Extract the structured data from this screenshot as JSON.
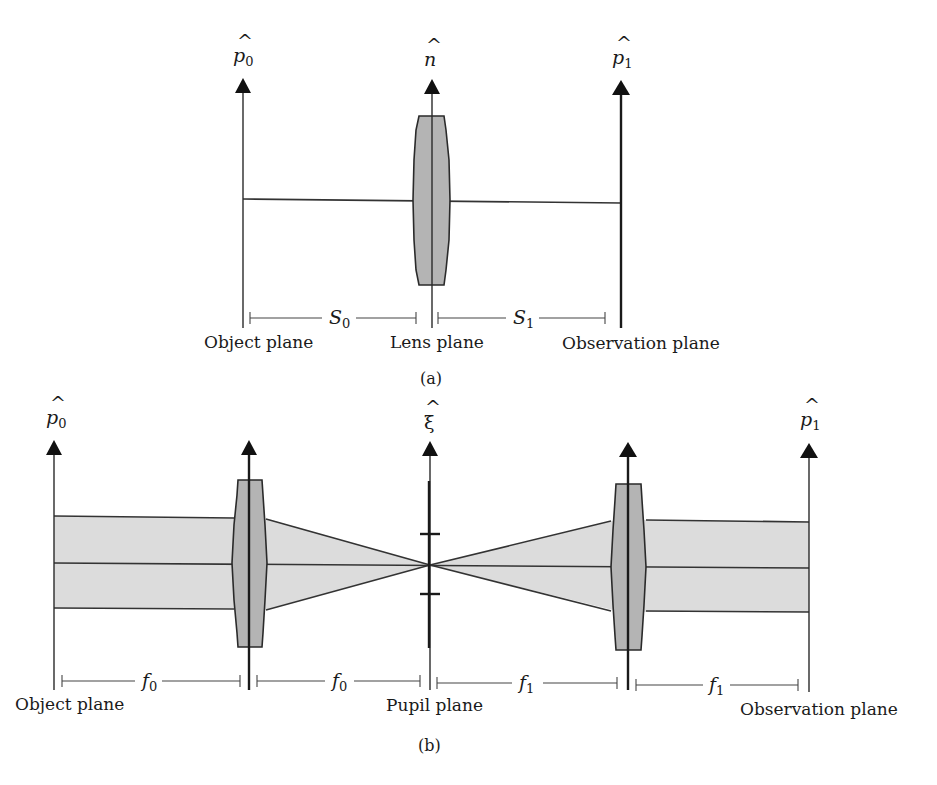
{
  "figure": {
    "panel_a": {
      "caption": "(a)",
      "axes": [
        {
          "id": "object",
          "symbol": "p",
          "subscript": "0",
          "plane_label": "Object plane"
        },
        {
          "id": "lens",
          "symbol": "n",
          "subscript": "",
          "plane_label": "Lens plane"
        },
        {
          "id": "observation",
          "symbol": "p",
          "subscript": "1",
          "plane_label": "Observation plane"
        }
      ],
      "distances": [
        {
          "symbol": "S",
          "subscript": "0"
        },
        {
          "symbol": "S",
          "subscript": "1"
        }
      ]
    },
    "panel_b": {
      "caption": "(b)",
      "axes": [
        {
          "id": "object",
          "symbol": "p",
          "subscript": "0",
          "plane_label": "Object plane"
        },
        {
          "id": "lens1",
          "symbol": "",
          "subscript": "",
          "plane_label": ""
        },
        {
          "id": "pupil",
          "symbol": "ξ",
          "subscript": "",
          "plane_label": "Pupil plane"
        },
        {
          "id": "lens2",
          "symbol": "",
          "subscript": "",
          "plane_label": ""
        },
        {
          "id": "observation",
          "symbol": "p",
          "subscript": "1",
          "plane_label": "Observation plane"
        }
      ],
      "distances": [
        {
          "symbol": "f",
          "subscript": "0"
        },
        {
          "symbol": "f",
          "subscript": "0"
        },
        {
          "symbol": "f",
          "subscript": "1"
        },
        {
          "symbol": "f",
          "subscript": "1"
        }
      ]
    },
    "hat": "^",
    "colors": {
      "lens_fill": "#b4b4b4",
      "beam_fill": "#dcdcdc",
      "line": "#2a2a2a"
    }
  }
}
